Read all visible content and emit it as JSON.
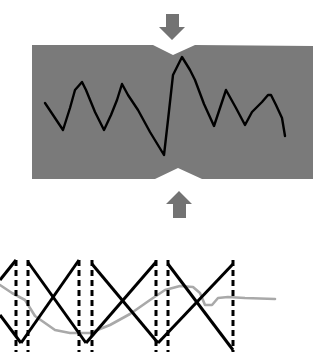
{
  "diagram": {
    "type": "notched-specimen-compression",
    "colors": {
      "background": "#ffffff",
      "specimen_fill": "#7a7a7a",
      "arrow_fill": "#737373",
      "crack_line": "#000000",
      "zigzag_line": "#000000",
      "dashed_line": "#000000",
      "gray_curve": "#a9a9a9"
    },
    "specimen": {
      "label": "",
      "outline": [
        [
          32,
          45
        ],
        [
          153,
          45
        ],
        [
          173,
          55
        ],
        [
          195,
          45
        ],
        [
          313,
          46
        ],
        [
          313,
          179
        ],
        [
          202,
          179
        ],
        [
          178,
          168
        ],
        [
          155,
          179
        ],
        [
          32,
          179
        ]
      ]
    },
    "arrows": [
      {
        "name": "top-arrow",
        "direction": "down",
        "tip": [
          172,
          40
        ]
      },
      {
        "name": "bottom-arrow",
        "direction": "up",
        "tip": [
          179,
          191
        ]
      }
    ],
    "crack_path": [
      [
        45,
        103
      ],
      [
        55,
        118
      ],
      [
        63,
        130
      ],
      [
        70,
        108
      ],
      [
        75,
        90
      ],
      [
        82,
        82
      ],
      [
        86,
        90
      ],
      [
        95,
        112
      ],
      [
        104,
        130
      ],
      [
        111,
        115
      ],
      [
        117,
        100
      ],
      [
        122,
        84
      ],
      [
        128,
        95
      ],
      [
        138,
        110
      ],
      [
        150,
        132
      ],
      [
        164,
        155
      ],
      [
        168,
        120
      ],
      [
        173,
        75
      ],
      [
        182,
        57
      ],
      [
        190,
        70
      ],
      [
        195,
        80
      ],
      [
        204,
        104
      ],
      [
        214,
        126
      ],
      [
        220,
        108
      ],
      [
        226,
        90
      ],
      [
        236,
        108
      ],
      [
        245,
        125
      ],
      [
        252,
        112
      ],
      [
        262,
        102
      ],
      [
        268,
        95
      ],
      [
        271,
        95
      ],
      [
        276,
        105
      ],
      [
        282,
        118
      ],
      [
        285,
        136
      ]
    ],
    "zigzag_segments": [
      [
        [
          0,
          280
        ],
        [
          16,
          260
        ]
      ],
      [
        [
          0,
          315
        ],
        [
          21,
          343
        ]
      ],
      [
        [
          16,
          260
        ],
        [
          16,
          350
        ]
      ],
      [
        [
          28,
          262
        ],
        [
          28,
          350
        ]
      ],
      [
        [
          28,
          262
        ],
        [
          86,
          343
        ]
      ],
      [
        [
          21,
          343
        ],
        [
          79,
          260
        ]
      ],
      [
        [
          79,
          260
        ],
        [
          79,
          350
        ]
      ],
      [
        [
          92,
          264
        ],
        [
          92,
          350
        ]
      ],
      [
        [
          92,
          264
        ],
        [
          158,
          343
        ]
      ],
      [
        [
          86,
          343
        ],
        [
          156,
          262
        ]
      ],
      [
        [
          156,
          262
        ],
        [
          156,
          350
        ]
      ],
      [
        [
          168,
          264
        ],
        [
          168,
          350
        ]
      ],
      [
        [
          168,
          264
        ],
        [
          233,
          350
        ]
      ],
      [
        [
          158,
          343
        ],
        [
          233,
          264
        ]
      ],
      [
        [
          233,
          264
        ],
        [
          233,
          350
        ]
      ]
    ],
    "dashed_lines_x": [
      16,
      28,
      79,
      92,
      156,
      168,
      233
    ],
    "gray_curve": [
      [
        0,
        285
      ],
      [
        12,
        293
      ],
      [
        25,
        300
      ],
      [
        35,
        316
      ],
      [
        55,
        330
      ],
      [
        70,
        333
      ],
      [
        90,
        333
      ],
      [
        110,
        325
      ],
      [
        130,
        314
      ],
      [
        150,
        300
      ],
      [
        165,
        290
      ],
      [
        180,
        286
      ],
      [
        193,
        287
      ],
      [
        200,
        293
      ],
      [
        205,
        305
      ],
      [
        212,
        305
      ],
      [
        218,
        298
      ],
      [
        228,
        297
      ],
      [
        245,
        298
      ],
      [
        275,
        299
      ]
    ]
  }
}
